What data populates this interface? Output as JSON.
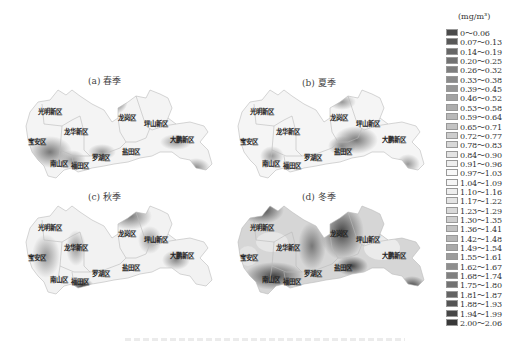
{
  "chart_data": {
    "type": "heatmap",
    "unit": "(mg/m³)",
    "panels": [
      {
        "id": "a",
        "title": "(a) 春季",
        "season": "spring",
        "dark_areas": [
          "龙岗区 north",
          "南山区",
          "大鹏新区 south"
        ]
      },
      {
        "id": "b",
        "title": "(b) 夏季",
        "season": "summer",
        "dark_areas": [
          "盐田区",
          "龙岗区 south"
        ]
      },
      {
        "id": "c",
        "title": "(c) 秋季",
        "season": "autumn",
        "dark_areas": [
          "龙岗区 north",
          "福田区",
          "大鹏新区"
        ]
      },
      {
        "id": "d",
        "title": "(d) 冬季",
        "season": "winter",
        "dark_areas": [
          "光明新区 north",
          "南山区",
          "龙岗区",
          "盐田区",
          "大鹏新区 south"
        ]
      }
    ],
    "districts": [
      "光明新区",
      "龙华新区",
      "宝安区",
      "南山区",
      "福田区",
      "罗湖区",
      "盐田区",
      "龙岗区",
      "坪山新区",
      "大鹏新区"
    ],
    "legend": {
      "title": "(mg/m³)",
      "position": "right",
      "entries": [
        {
          "label": "0～0.06",
          "color": "#4a4a4a"
        },
        {
          "label": "0.07～0.13",
          "color": "#585858"
        },
        {
          "label": "0.14～0.19",
          "color": "#666666"
        },
        {
          "label": "0.20～0.25",
          "color": "#727272"
        },
        {
          "label": "0.26～0.32",
          "color": "#7e7e7e"
        },
        {
          "label": "0.33～0.38",
          "color": "#8a8a8a"
        },
        {
          "label": "0.39～0.45",
          "color": "#969696"
        },
        {
          "label": "0.46～0.52",
          "color": "#a2a2a2"
        },
        {
          "label": "0.53～0.58",
          "color": "#adadad"
        },
        {
          "label": "0.59～0.64",
          "color": "#b8b8b8"
        },
        {
          "label": "0.65～0.71",
          "color": "#c3c3c3"
        },
        {
          "label": "0.72～0.77",
          "color": "#cdcdcd"
        },
        {
          "label": "0.78～0.83",
          "color": "#d8d8d8"
        },
        {
          "label": "0.84～0.90",
          "color": "#e3e3e3"
        },
        {
          "label": "0.91～0.96",
          "color": "#eeeeee"
        },
        {
          "label": "0.97～1.03",
          "color": "#f8f8f8"
        },
        {
          "label": "1.04～1.09",
          "color": "#f6f6f6"
        },
        {
          "label": "1.10～1.16",
          "color": "#eeeeee"
        },
        {
          "label": "1.17～1.22",
          "color": "#e4e4e4"
        },
        {
          "label": "1.23～1.29",
          "color": "#d9d9d9"
        },
        {
          "label": "1.30～1.35",
          "color": "#cecece"
        },
        {
          "label": "1.36～1.41",
          "color": "#c2c2c2"
        },
        {
          "label": "1.42～1.48",
          "color": "#b6b6b6"
        },
        {
          "label": "1.49～1.54",
          "color": "#a9a9a9"
        },
        {
          "label": "1.55～1.61",
          "color": "#9c9c9c"
        },
        {
          "label": "1.62～1.67",
          "color": "#8e8e8e"
        },
        {
          "label": "1.68～1.74",
          "color": "#808080"
        },
        {
          "label": "1.75～1.80",
          "color": "#727272"
        },
        {
          "label": "1.81～1.87",
          "color": "#636363"
        },
        {
          "label": "1.88～1.93",
          "color": "#545454"
        },
        {
          "label": "1.94～1.99",
          "color": "#464646"
        },
        {
          "label": "2.00～2.06",
          "color": "#383838"
        }
      ]
    }
  },
  "panels": {
    "a": {
      "title": "(a) 春季"
    },
    "b": {
      "title": "(b) 夏季"
    },
    "c": {
      "title": "(c) 秋季"
    },
    "d": {
      "title": "(d) 冬季"
    }
  },
  "labels": {
    "guangming": "光明新区",
    "longhua": "龙华新区",
    "baoan": "宝安区",
    "nanshan": "南山区",
    "futian": "福田区",
    "luohu": "罗湖区",
    "yantian": "盐田区",
    "longgang": "龙岗区",
    "pingshan": "坪山新区",
    "dapeng": "大鹏新区"
  },
  "legend": {
    "unit": "(mg/m³)"
  }
}
